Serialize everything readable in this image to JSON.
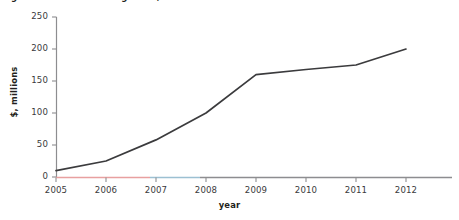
{
  "figure": {
    "caption": "Figure: annual revenue growth, 2005–2012",
    "background": "#ffffff"
  },
  "chart_data": {
    "type": "line",
    "title": "",
    "xlabel": "year",
    "ylabel": "$, millions",
    "categories": [
      "2005",
      "2006",
      "2007",
      "2008",
      "2009",
      "2010",
      "2011",
      "2012"
    ],
    "x": [
      2005,
      2006,
      2007,
      2008,
      2009,
      2010,
      2011,
      2012
    ],
    "values": [
      10,
      25,
      58,
      100,
      160,
      168,
      175,
      200
    ],
    "series": [
      {
        "name": "$, millions",
        "values": [
          10,
          25,
          58,
          100,
          160,
          168,
          175,
          200
        ],
        "color": "#3b3b3d",
        "line_width": 1.7
      }
    ],
    "ylim": [
      0,
      250
    ],
    "yticks": [
      0,
      50,
      100,
      150,
      200,
      250
    ],
    "ytick_labels": [
      "0",
      "50",
      "100",
      "150",
      "200",
      "250"
    ],
    "xtick_labels": [
      "2005",
      "2006",
      "2007",
      "2008",
      "2009",
      "2010",
      "2011",
      "2012"
    ],
    "grid": false,
    "legend": "none",
    "axis_color": "#8d8d90",
    "axis_segment_colors": [
      "#e8a0a0",
      "#9cc0d2",
      "#8d8d90"
    ],
    "tick_label_color": "#3a3a3c",
    "axis_title_color": "#231f20"
  }
}
